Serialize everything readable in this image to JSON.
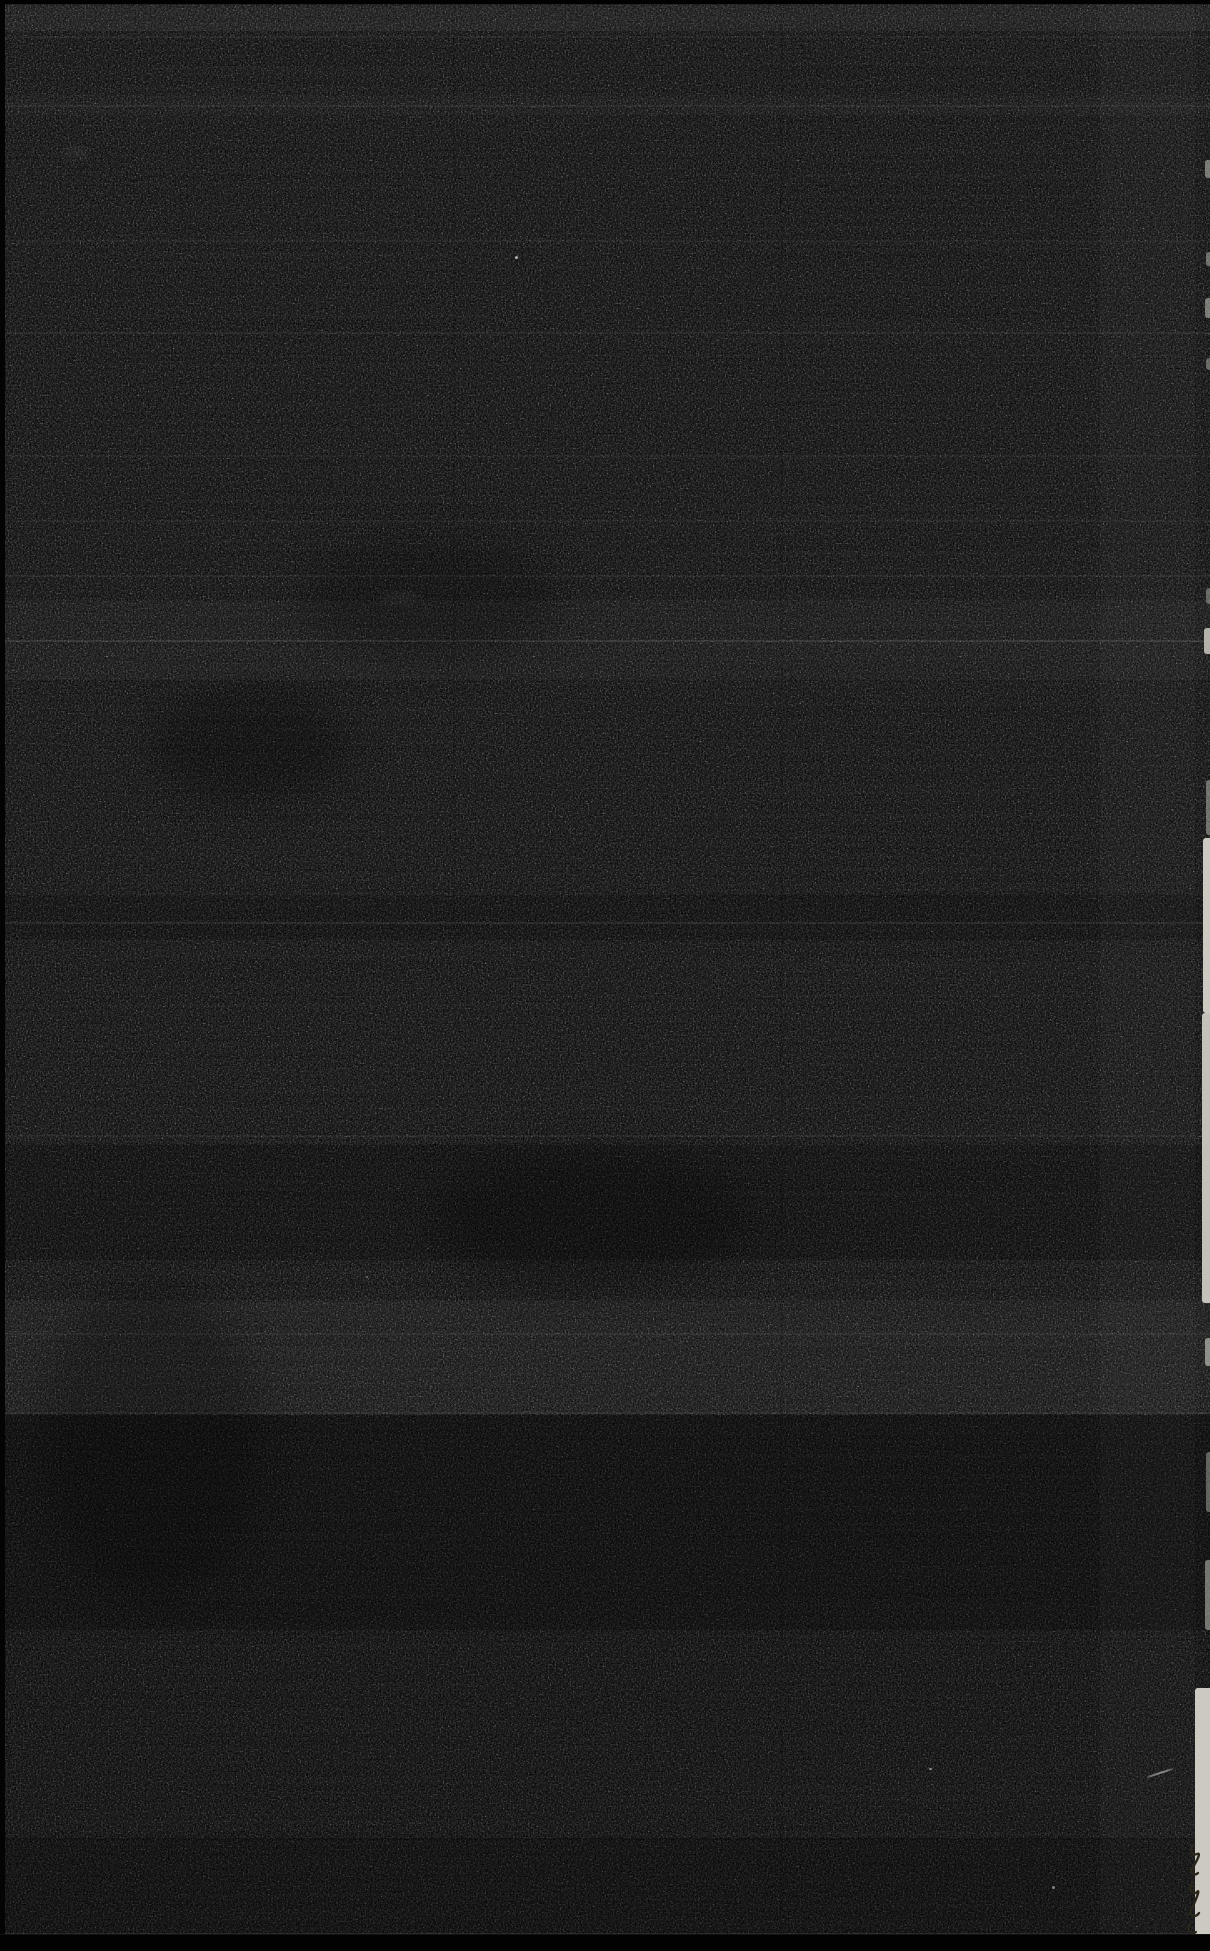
{
  "scan": {
    "width": 1210,
    "height": 1951,
    "colors": {
      "base": "#0c0c0c",
      "grain_light": "#2a2a2a",
      "edge_black": "#020202",
      "left_edge": "#040404",
      "paper_strip": "#d6d3cb",
      "speck": "#e8e6e0",
      "pen_mark": "#2a261c",
      "bottom_ridge": "rgba(255,255,255,0.07)"
    },
    "bands": [
      {
        "y": 5,
        "h": 26,
        "tone": "light",
        "o": 0.045
      },
      {
        "y": 95,
        "h": 20,
        "tone": "light",
        "o": 0.02
      },
      {
        "y": 600,
        "h": 80,
        "tone": "light",
        "o": 0.025
      },
      {
        "y": 895,
        "h": 45,
        "tone": "dark",
        "o": 0.15
      },
      {
        "y": 1145,
        "h": 115,
        "tone": "dark",
        "o": 0.18
      },
      {
        "y": 1300,
        "h": 112,
        "tone": "light",
        "o": 0.03
      },
      {
        "y": 1415,
        "h": 215,
        "tone": "dark",
        "o": 0.3
      },
      {
        "y": 1630,
        "h": 210,
        "tone": "dark",
        "o": 0.12
      },
      {
        "y": 1838,
        "h": 98,
        "tone": "dark",
        "o": 0.28
      }
    ],
    "scanlines": [
      {
        "y": 36,
        "o": 0.04
      },
      {
        "y": 105,
        "o": 0.05
      },
      {
        "y": 240,
        "o": 0.04
      },
      {
        "y": 332,
        "o": 0.05
      },
      {
        "y": 455,
        "o": 0.04
      },
      {
        "y": 520,
        "o": 0.04
      },
      {
        "y": 575,
        "o": 0.05
      },
      {
        "y": 640,
        "o": 0.09
      },
      {
        "y": 922,
        "o": 0.07
      },
      {
        "y": 1135,
        "o": 0.05
      },
      {
        "y": 1333,
        "o": 0.05
      },
      {
        "y": 1412,
        "o": 0.08
      },
      {
        "y": 1933,
        "o": 0.08
      }
    ],
    "creases": [
      {
        "x": 453,
        "w": 2,
        "tone": "dark",
        "o": 0.1,
        "y": 0,
        "h": 930
      },
      {
        "x": 780,
        "w": 3,
        "tone": "dark",
        "o": 0.08,
        "y": 0,
        "h": 1951
      },
      {
        "x": 1100,
        "w": 95,
        "tone": "light",
        "o": 0.018,
        "y": 0,
        "h": 1951
      }
    ],
    "right_edge_segments": [
      {
        "y": 160,
        "h": 18,
        "w": 5,
        "o": 0.5
      },
      {
        "y": 252,
        "h": 14,
        "w": 4,
        "o": 0.45
      },
      {
        "y": 298,
        "h": 20,
        "w": 5,
        "o": 0.5
      },
      {
        "y": 358,
        "h": 12,
        "w": 4,
        "o": 0.4
      },
      {
        "y": 588,
        "h": 16,
        "w": 4,
        "o": 0.4
      },
      {
        "y": 628,
        "h": 26,
        "w": 6,
        "o": 0.8
      },
      {
        "y": 780,
        "h": 55,
        "w": 4,
        "o": 0.45
      },
      {
        "y": 838,
        "h": 175,
        "w": 7,
        "o": 0.95
      },
      {
        "y": 1013,
        "h": 290,
        "w": 8,
        "o": 0.9
      },
      {
        "y": 1338,
        "h": 28,
        "w": 5,
        "o": 0.6
      },
      {
        "y": 1452,
        "h": 60,
        "w": 4,
        "o": 0.4
      },
      {
        "y": 1560,
        "h": 70,
        "w": 5,
        "o": 0.5
      },
      {
        "y": 1688,
        "h": 263,
        "w": 15,
        "o": 0.95
      }
    ],
    "specks": [
      {
        "x": 515,
        "y": 256,
        "w": 3,
        "h": 3,
        "o": 0.75,
        "rot": 0,
        "blur": 0
      },
      {
        "x": 929,
        "y": 1768,
        "w": 3,
        "h": 2,
        "o": 0.6,
        "rot": 0,
        "blur": 0
      },
      {
        "x": 1052,
        "y": 1886,
        "w": 3,
        "h": 3,
        "o": 0.55,
        "rot": 0,
        "blur": 0
      },
      {
        "x": 366,
        "y": 1276,
        "w": 2,
        "h": 2,
        "o": 0.4,
        "rot": 0,
        "blur": 0
      },
      {
        "x": 1146,
        "y": 1772,
        "w": 28,
        "h": 2,
        "o": 0.5,
        "rot": -18,
        "blur": 0.5
      },
      {
        "x": 63,
        "y": 148,
        "w": 26,
        "h": 10,
        "o": 0.06,
        "rot": 0,
        "blur": 3
      },
      {
        "x": 380,
        "y": 592,
        "w": 40,
        "h": 10,
        "o": 0.05,
        "rot": 0,
        "blur": 3
      }
    ],
    "shadow_blobs": [
      {
        "x": 150,
        "y": 690,
        "w": 200,
        "h": 110,
        "o": 0.25
      },
      {
        "x": 300,
        "y": 540,
        "w": 260,
        "h": 120,
        "o": 0.2
      },
      {
        "x": 430,
        "y": 1150,
        "w": 320,
        "h": 140,
        "o": 0.22
      },
      {
        "x": 40,
        "y": 1280,
        "w": 220,
        "h": 320,
        "o": 0.2
      }
    ],
    "pen_marks": {
      "p0": "M26 6 C20 12 24 18 29 16 C34 14 28 24 24 31 C21 36 27 38 30 35",
      "p1": "M25 44 C19 52 25 58 29 54 C33 50 27 64 23 72 C20 78 28 80 31 75",
      "p2": "M22 86 C18 92 24 98 28 94"
    }
  }
}
